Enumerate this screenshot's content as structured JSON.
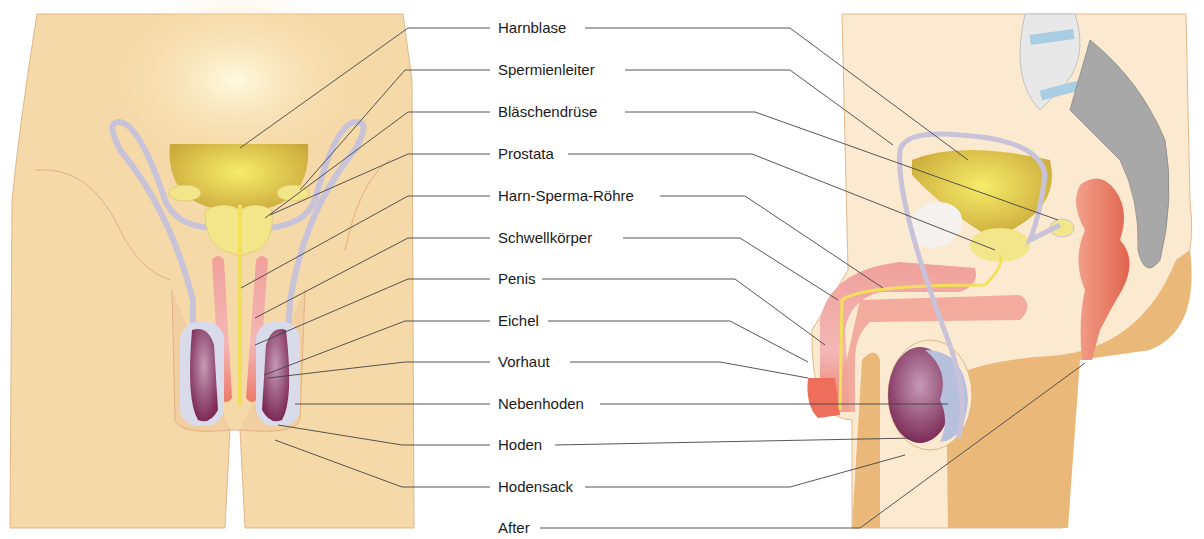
{
  "diagram": {
    "views": [
      {
        "name": "front-view",
        "description": "Frontalansicht"
      },
      {
        "name": "side-view",
        "description": "Seitenansicht (Sagittalschnitt)"
      }
    ],
    "labels": [
      {
        "id": "harnblase",
        "text": "Harnblase",
        "y": 28
      },
      {
        "id": "spermienleiter",
        "text": "Spermienleiter",
        "y": 70
      },
      {
        "id": "blaeschendruese",
        "text": "Bläschendrüse",
        "y": 112
      },
      {
        "id": "prostata",
        "text": "Prostata",
        "y": 154
      },
      {
        "id": "harn-sperma-roehre",
        "text": "Harn-Sperma-Röhre",
        "y": 196
      },
      {
        "id": "schwellkoerper",
        "text": "Schwellkörper",
        "y": 238
      },
      {
        "id": "penis",
        "text": "Penis",
        "y": 279
      },
      {
        "id": "eichel",
        "text": "Eichel",
        "y": 321
      },
      {
        "id": "vorhaut",
        "text": "Vorhaut",
        "y": 362
      },
      {
        "id": "nebenhoden",
        "text": "Nebenhoden",
        "y": 404
      },
      {
        "id": "hoden",
        "text": "Hoden",
        "y": 445
      },
      {
        "id": "hodensack",
        "text": "Hodensack",
        "y": 487
      },
      {
        "id": "after",
        "text": "After",
        "y": 528
      }
    ],
    "colors": {
      "skin": "#f6d9a8",
      "skin_shadow": "#eab878",
      "bladder": "#e3cf4a",
      "gland": "#f3e589",
      "erectile": "#ec8e86",
      "testis": "#8b3c66",
      "epididymis": "#b6bfdc",
      "duct": "#c9c3d9",
      "rectum": "#e8705e",
      "bone": "#cfcfcf",
      "disc": "#a9cde3",
      "leader": "#444444"
    }
  }
}
